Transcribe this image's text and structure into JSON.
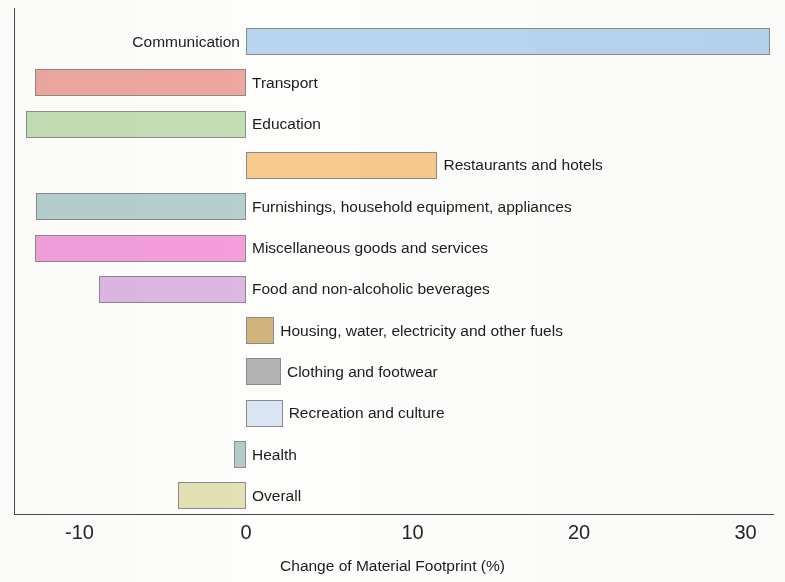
{
  "chart_data": {
    "type": "bar",
    "orientation": "horizontal",
    "title": "",
    "xlabel": "Change of Material Footprint (%)",
    "ylabel": "",
    "xlim": [
      -13.9,
      32.0
    ],
    "xticks": [
      -10,
      0,
      10,
      20,
      30
    ],
    "xtick_labels": [
      "-10",
      "0",
      "10",
      "20",
      "30"
    ],
    "grid": false,
    "legend": false,
    "zero_line": 0,
    "categories": [
      "Communication",
      "Transport",
      "Education",
      "Restaurants and hotels",
      "Furnishings, household equipment, appliances",
      "Miscellaneous goods and services",
      "Food and non-alcoholic beverages",
      "Housing, water, electricity and other fuels",
      "Clothing and footwear",
      "Recreation and culture",
      "Health",
      "Overall"
    ],
    "values": [
      31.5,
      -12.7,
      -13.2,
      11.5,
      -12.6,
      -12.7,
      -8.8,
      1.7,
      2.1,
      2.2,
      -0.7,
      -4.1
    ],
    "colors": [
      "#b8d4ee",
      "#eda6a0",
      "#c3ddb5",
      "#f7c98b",
      "#b6cfce",
      "#f29fdb",
      "#ddb6e3",
      "#d2b47e",
      "#b3b3b3",
      "#d9e5f2",
      "#b3ccc7",
      "#e3e0b4"
    ],
    "bars": [
      {
        "label": "Communication",
        "value": 31.5,
        "color": "#b8d4ee",
        "label_side": "left"
      },
      {
        "label": "Transport",
        "value": -12.7,
        "color": "#eda6a0",
        "label_side": "right"
      },
      {
        "label": "Education",
        "value": -13.2,
        "color": "#c3ddb5",
        "label_side": "right"
      },
      {
        "label": "Restaurants and hotels",
        "value": 11.5,
        "color": "#f7c98b",
        "label_side": "right"
      },
      {
        "label": "Furnishings, household equipment, appliances",
        "value": -12.6,
        "color": "#b6cfce",
        "label_side": "right"
      },
      {
        "label": "Miscellaneous goods and services",
        "value": -12.7,
        "color": "#f29fdb",
        "label_side": "right"
      },
      {
        "label": "Food and non-alcoholic beverages",
        "value": -8.8,
        "color": "#ddb6e3",
        "label_side": "right"
      },
      {
        "label": "Housing, water, electricity and other fuels",
        "value": 1.7,
        "color": "#d2b47e",
        "label_side": "right"
      },
      {
        "label": "Clothing and footwear",
        "value": 2.1,
        "color": "#b3b3b3",
        "label_side": "right"
      },
      {
        "label": "Recreation and culture",
        "value": 2.2,
        "color": "#d9e5f2",
        "label_side": "right"
      },
      {
        "label": "Health",
        "value": -0.7,
        "color": "#b3ccc7",
        "label_side": "right"
      },
      {
        "label": "Overall",
        "value": -4.1,
        "color": "#e3e0b4",
        "label_side": "right"
      }
    ]
  },
  "axis": {
    "x_title": "Change of Material Footprint (%)",
    "ticks": [
      "-10",
      "0",
      "10",
      "20",
      "30"
    ]
  }
}
